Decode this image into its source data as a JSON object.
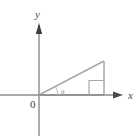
{
  "figure": {
    "background_color": "#ffffff",
    "axis_color": "#808080",
    "triangle_color": "#a6a6a6",
    "label_color": "#4a4a4a",
    "angle_label_color": "#8a8a8a"
  },
  "axes": {
    "x_label": "x",
    "y_label": "y",
    "origin_label": "0",
    "x_axis": {
      "x1": 0,
      "y1": 95,
      "x2": 122,
      "y2": 95
    },
    "y_axis": {
      "x1": 39,
      "y1": 135,
      "x2": 39,
      "y2": 23
    },
    "x_arrow_tip": {
      "x": 122,
      "y": 95
    },
    "y_arrow_tip": {
      "x": 39,
      "y": 23
    }
  },
  "triangle": {
    "vertices": [
      {
        "name": "origin",
        "x": 39,
        "y": 95
      },
      {
        "name": "base-right",
        "x": 104,
        "y": 95
      },
      {
        "name": "apex",
        "x": 104,
        "y": 61
      }
    ],
    "right_angle_marker": {
      "x": 89,
      "y": 80,
      "size": 15
    },
    "angle_label": "θ",
    "angle_arc": {
      "cx": 39,
      "cy": 95,
      "radius": 20,
      "start_deg": 0,
      "end_deg": 27
    }
  }
}
